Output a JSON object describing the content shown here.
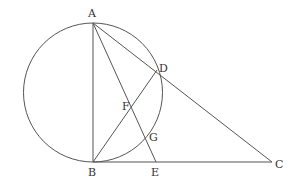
{
  "diagram": {
    "type": "geometry",
    "circle": {
      "cx": 93,
      "cy": 92.5,
      "r": 69.5
    },
    "points": {
      "A": {
        "label": "A",
        "x": 93,
        "y": 23,
        "lx": 88,
        "ly": 17
      },
      "B": {
        "label": "B",
        "x": 93,
        "y": 162,
        "lx": 88,
        "ly": 176
      },
      "C": {
        "label": "C",
        "x": 272,
        "y": 162,
        "lx": 275,
        "ly": 168
      },
      "D": {
        "label": "D",
        "x": 157,
        "y": 70,
        "lx": 159,
        "ly": 72
      },
      "E": {
        "label": "E",
        "x": 156,
        "y": 162,
        "lx": 151,
        "ly": 176
      },
      "F": {
        "label": "F",
        "x": 130,
        "y": 105,
        "lx": 122,
        "ly": 110
      },
      "G": {
        "label": "G",
        "x": 147,
        "y": 128,
        "lx": 149,
        "ly": 141
      }
    },
    "segments": [
      [
        "A",
        "B"
      ],
      [
        "A",
        "C"
      ],
      [
        "A",
        "E"
      ],
      [
        "B",
        "D"
      ],
      [
        "B",
        "C"
      ]
    ]
  }
}
